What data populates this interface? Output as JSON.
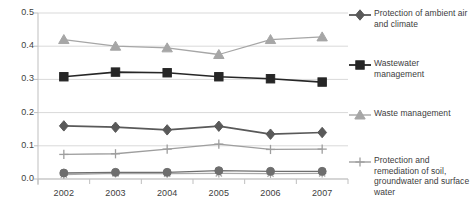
{
  "chart_data": {
    "type": "line",
    "title": "",
    "subtitle": "",
    "xlabel": "",
    "ylabel": "",
    "categories": [
      "2002",
      "2003",
      "2004",
      "2005",
      "2006",
      "2007"
    ],
    "x_tick_labels": [
      "2002",
      "2003",
      "2004",
      "2005",
      "2006",
      "2007"
    ],
    "y_tick_labels": [
      "0.0",
      "0.1",
      "0.2",
      "0.3",
      "0.4",
      "0.5"
    ],
    "y_tick_values": [
      0.0,
      0.1,
      0.2,
      0.3,
      0.4,
      0.5
    ],
    "ylim": [
      0.0,
      0.5
    ],
    "grid": "horizontal",
    "legend_position": "right",
    "series": [
      {
        "name": "Protection of ambient air and climate",
        "marker": "diamond",
        "color": "#595959",
        "in_legend": true,
        "values": [
          0.16,
          0.156,
          0.148,
          0.159,
          0.135,
          0.14
        ]
      },
      {
        "name": "Wastewater management",
        "marker": "square",
        "color": "#262626",
        "in_legend": true,
        "values": [
          0.308,
          0.322,
          0.32,
          0.308,
          0.302,
          0.292
        ]
      },
      {
        "name": "Waste management",
        "marker": "triangle",
        "color": "#a6a6a6",
        "in_legend": true,
        "values": [
          0.42,
          0.4,
          0.395,
          0.375,
          0.42,
          0.428
        ]
      },
      {
        "name": "Protection and remediation of soil, groundwater and surface water",
        "marker": "plus",
        "color": "#9e9e9e",
        "in_legend": true,
        "values": [
          0.074,
          0.076,
          0.09,
          0.105,
          0.089,
          0.09
        ]
      },
      {
        "name": "",
        "marker": "circle",
        "color": "#6e6e6e",
        "in_legend": false,
        "values": [
          0.018,
          0.02,
          0.02,
          0.025,
          0.023,
          0.023
        ]
      },
      {
        "name": "",
        "marker": "star",
        "color": "#a9a9a9",
        "in_legend": false,
        "values": [
          0.013,
          0.017,
          0.016,
          0.017,
          0.016,
          0.017
        ]
      }
    ],
    "legend_entries": [
      {
        "label": "Protection of ambient air and climate",
        "marker": "diamond",
        "color": "#595959"
      },
      {
        "label": "Wastewater management",
        "marker": "square",
        "color": "#262626"
      },
      {
        "label": "Waste management",
        "marker": "triangle",
        "color": "#a6a6a6"
      },
      {
        "label": "Protection and remediation of soil, groundwater and surface water",
        "marker": "plus",
        "color": "#9e9e9e"
      }
    ]
  },
  "colors": {
    "grid": "#d9d9d9",
    "axis": "#bfbfbf",
    "text": "#404040",
    "background": "#ffffff"
  }
}
